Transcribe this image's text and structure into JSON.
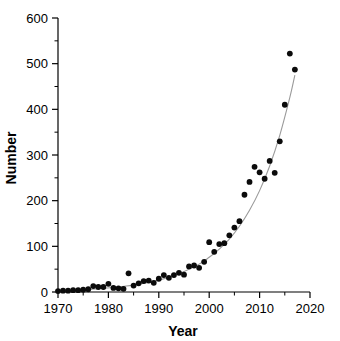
{
  "chart_data": {
    "type": "scatter",
    "title": "",
    "xlabel": "Year",
    "ylabel": "Number",
    "xlim": [
      1970,
      2020
    ],
    "ylim": [
      0,
      600
    ],
    "grid": false,
    "legend": "none",
    "x_ticks_major": [
      1970,
      1980,
      1990,
      2000,
      2010,
      2020
    ],
    "x_ticks_minor": [
      1975,
      1985,
      1995,
      2005,
      2015
    ],
    "y_ticks_major": [
      0,
      100,
      200,
      300,
      400,
      500,
      600
    ],
    "y_ticks_minor": [
      50,
      150,
      250,
      350,
      450,
      550
    ],
    "x_tick_labels": [
      "1970",
      "1980",
      "1990",
      "2000",
      "2010",
      "2020"
    ],
    "y_tick_labels": [
      "0",
      "100",
      "200",
      "300",
      "400",
      "500",
      "600"
    ],
    "series": [
      {
        "name": "Number per year",
        "marker": "filled-circle",
        "color": "#0b0b0b",
        "x": [
          1970,
          1971,
          1972,
          1973,
          1974,
          1975,
          1976,
          1977,
          1978,
          1979,
          1980,
          1981,
          1982,
          1983,
          1984,
          1985,
          1986,
          1987,
          1988,
          1989,
          1990,
          1991,
          1992,
          1993,
          1994,
          1995,
          1996,
          1997,
          1998,
          1999,
          2000,
          2001,
          2002,
          2003,
          2004,
          2005,
          2006,
          2007,
          2008,
          2009,
          2010,
          2011,
          2012,
          2013,
          2014,
          2015,
          2016,
          2017
        ],
        "y": [
          2,
          3,
          3,
          4,
          4,
          5,
          6,
          13,
          11,
          11,
          18,
          9,
          8,
          7,
          41,
          14,
          19,
          24,
          25,
          20,
          29,
          37,
          31,
          37,
          42,
          38,
          56,
          58,
          53,
          66,
          109,
          88,
          105,
          107,
          124,
          141,
          155,
          213,
          241,
          274,
          262,
          248,
          287,
          261,
          330,
          410,
          522,
          487
        ]
      },
      {
        "name": "Exponential fit",
        "marker": "line",
        "color": "#9a9a9a",
        "x": [
          1974,
          1978,
          1982,
          1986,
          1990,
          1994,
          1998,
          2000,
          2002,
          2004,
          2006,
          2008,
          2010,
          2012,
          2014,
          2016,
          2017
        ],
        "y": [
          4,
          7,
          11,
          17,
          26,
          40,
          61,
          76,
          94,
          116,
          144,
          179,
          222,
          276,
          343,
          426,
          475
        ]
      }
    ]
  },
  "axes": {
    "x_title": "Year",
    "y_title": "Number"
  }
}
